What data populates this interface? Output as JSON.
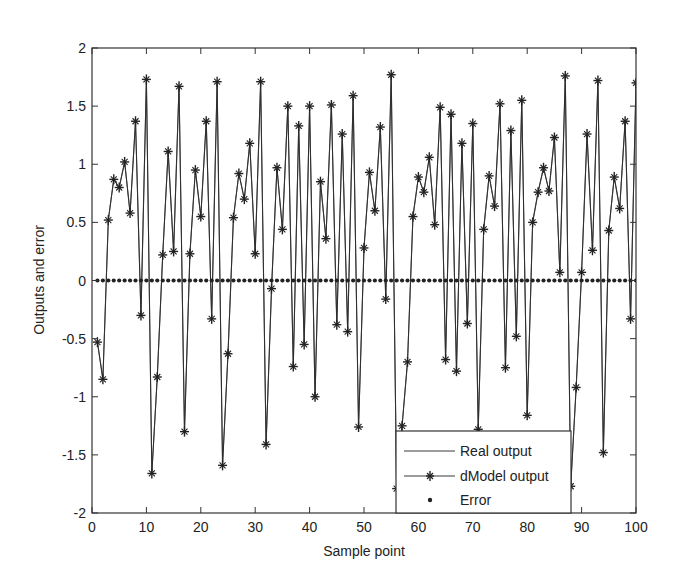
{
  "chart_data": {
    "type": "line",
    "title": "",
    "xlabel": "Sample point",
    "ylabel": "Outputs and error",
    "xlim": [
      0,
      100
    ],
    "ylim": [
      -2,
      2
    ],
    "xticks": [
      0,
      10,
      20,
      30,
      40,
      50,
      60,
      70,
      80,
      90,
      100
    ],
    "xtick_labels": [
      "0",
      "10",
      "20",
      "30",
      "40",
      "50",
      "60",
      "70",
      "80",
      "90",
      "100"
    ],
    "yticks": [
      -2,
      -1.5,
      -1,
      -0.5,
      0,
      0.5,
      1,
      1.5,
      2
    ],
    "ytick_labels": [
      "-2",
      "-1.5",
      "-1",
      "-0.5",
      "0",
      "0.5",
      "1",
      "1.5",
      "2"
    ],
    "grid": false,
    "legend_position": "lower right",
    "x": [
      1,
      2,
      3,
      4,
      5,
      6,
      7,
      8,
      9,
      10,
      11,
      12,
      13,
      14,
      15,
      16,
      17,
      18,
      19,
      20,
      21,
      22,
      23,
      24,
      25,
      26,
      27,
      28,
      29,
      30,
      31,
      32,
      33,
      34,
      35,
      36,
      37,
      38,
      39,
      40,
      41,
      42,
      43,
      44,
      45,
      46,
      47,
      48,
      49,
      50,
      51,
      52,
      53,
      54,
      55,
      56,
      57,
      58,
      59,
      60,
      61,
      62,
      63,
      64,
      65,
      66,
      67,
      68,
      69,
      70,
      71,
      72,
      73,
      74,
      75,
      76,
      77,
      78,
      79,
      80,
      81,
      82,
      83,
      84,
      85,
      86,
      87,
      88,
      89,
      90,
      91,
      92,
      93,
      94,
      95,
      96,
      97,
      98,
      99,
      100
    ],
    "series": [
      {
        "name": "Real output",
        "style": "solid line",
        "color": "#333333",
        "values": [
          -0.53,
          -0.85,
          0.52,
          0.87,
          0.8,
          1.02,
          0.58,
          1.37,
          -0.3,
          1.73,
          -1.66,
          -0.83,
          0.22,
          1.11,
          0.25,
          1.67,
          -1.3,
          0.23,
          0.95,
          0.55,
          1.37,
          -0.33,
          1.71,
          -1.59,
          -0.63,
          0.54,
          0.92,
          0.7,
          1.18,
          0.23,
          1.71,
          -1.41,
          -0.07,
          0.97,
          0.44,
          1.5,
          -0.74,
          1.33,
          -0.55,
          1.5,
          -1.0,
          0.85,
          0.36,
          1.51,
          -0.38,
          1.26,
          -0.44,
          1.59,
          -1.26,
          0.28,
          0.93,
          0.6,
          1.32,
          -0.16,
          1.77,
          -1.79,
          -1.25,
          -0.7,
          0.55,
          0.89,
          0.76,
          1.06,
          0.48,
          1.49,
          -0.68,
          1.43,
          -0.78,
          1.18,
          -0.37,
          1.35,
          -1.28,
          0.44,
          0.9,
          0.64,
          1.52,
          -0.75,
          1.29,
          -0.48,
          1.55,
          -1.16,
          0.5,
          0.76,
          0.97,
          0.77,
          1.23,
          0.07,
          1.76,
          -1.77,
          -0.92,
          0.07,
          1.26,
          0.26,
          1.72,
          -1.48,
          0.43,
          0.89,
          0.62,
          1.37,
          -0.33,
          1.7
        ]
      },
      {
        "name": "dModel output",
        "style": "line with star markers",
        "color": "#333333",
        "values": [
          -0.53,
          -0.85,
          0.52,
          0.87,
          0.8,
          1.02,
          0.58,
          1.37,
          -0.3,
          1.73,
          -1.66,
          -0.83,
          0.22,
          1.11,
          0.25,
          1.67,
          -1.3,
          0.23,
          0.95,
          0.55,
          1.37,
          -0.33,
          1.71,
          -1.59,
          -0.63,
          0.54,
          0.92,
          0.7,
          1.18,
          0.23,
          1.71,
          -1.41,
          -0.07,
          0.97,
          0.44,
          1.5,
          -0.74,
          1.33,
          -0.55,
          1.5,
          -1.0,
          0.85,
          0.36,
          1.51,
          -0.38,
          1.26,
          -0.44,
          1.59,
          -1.26,
          0.28,
          0.93,
          0.6,
          1.32,
          -0.16,
          1.77,
          -1.79,
          -1.25,
          -0.7,
          0.55,
          0.89,
          0.76,
          1.06,
          0.48,
          1.49,
          -0.68,
          1.43,
          -0.78,
          1.18,
          -0.37,
          1.35,
          -1.28,
          0.44,
          0.9,
          0.64,
          1.52,
          -0.75,
          1.29,
          -0.48,
          1.55,
          -1.16,
          0.5,
          0.76,
          0.97,
          0.77,
          1.23,
          0.07,
          1.76,
          -1.77,
          -0.92,
          0.07,
          1.26,
          0.26,
          1.72,
          -1.48,
          0.43,
          0.89,
          0.62,
          1.37,
          -0.33,
          1.7
        ]
      },
      {
        "name": "Error",
        "style": "dot markers",
        "color": "#222222",
        "values": [
          0,
          0,
          0,
          0,
          0,
          0,
          0,
          0,
          0,
          0,
          0,
          0,
          0,
          0,
          0,
          0,
          0,
          0,
          0,
          0,
          0,
          0,
          0,
          0,
          0,
          0,
          0,
          0,
          0,
          0,
          0,
          0,
          0,
          0,
          0,
          0,
          0,
          0,
          0,
          0,
          0,
          0,
          0,
          0,
          0,
          0,
          0,
          0,
          0,
          0,
          0,
          0,
          0,
          0,
          0,
          0,
          0,
          0,
          0,
          0,
          0,
          0,
          0,
          0,
          0,
          0,
          0,
          0,
          0,
          0,
          0,
          0,
          0,
          0,
          0,
          0,
          0,
          0,
          0,
          0,
          0,
          0,
          0,
          0,
          0,
          0,
          0,
          0,
          0,
          0,
          0,
          0,
          0,
          0,
          0,
          0,
          0,
          0,
          0,
          0
        ]
      }
    ]
  },
  "legend": {
    "items": [
      {
        "label": "Real output"
      },
      {
        "label": "dModel output"
      },
      {
        "label": "Error"
      }
    ]
  },
  "colors": {
    "axis": "#333333",
    "line": "#3a3a3a",
    "background": "#ffffff"
  }
}
